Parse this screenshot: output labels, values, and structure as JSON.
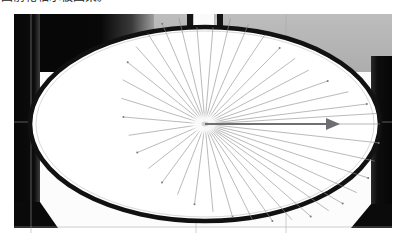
{
  "caption": {
    "text": "图前轮轴承被图架。",
    "note": "partially-clipped-chinese-caption"
  },
  "photo": {
    "title": "bicycle-front-wheel-oblique-photo",
    "frame": {
      "x": 14,
      "y": 14,
      "width": 378,
      "height": 219
    },
    "background_color": "#ffffff",
    "regions": [
      {
        "name": "top-left-dark-block",
        "color": "#0a0a0a",
        "x": 0,
        "y": 0,
        "width": 115,
        "height": 56
      },
      {
        "name": "top-right-gray-wall",
        "color": "#b5b5b5",
        "x": 115,
        "y": 0,
        "width": 263,
        "height": 56
      },
      {
        "name": "left-dark-column",
        "color": "#0b0b0b",
        "x": 0,
        "y": 0,
        "width": 24,
        "height": 215
      },
      {
        "name": "right-dark-column",
        "color": "#101010",
        "x": 358,
        "y": 40,
        "width": 20,
        "height": 175
      },
      {
        "name": "lower-white-floor",
        "color": "#fbfbfb",
        "x": 0,
        "y": 56,
        "width": 378,
        "height": 163
      }
    ],
    "guides": {
      "color": "#a9a9a9",
      "vertical_x": [
        17,
        182,
        272
      ],
      "horizontal_y": [
        108,
        213
      ]
    },
    "wheel": {
      "name": "front-wheel-ellipse",
      "center_x": 191,
      "center_y": 110,
      "radius_x": 175,
      "radius_y": 97,
      "rim_color": "#121212",
      "rim_width_px": 5,
      "tyre_fill": "#ffffff",
      "hub_center_x": 191,
      "hub_center_y": 110,
      "spoke_color": "#8e8e8e",
      "spoke_count": 32,
      "nipple_color": "#777777"
    },
    "fork": {
      "name": "front-fork",
      "color": "#151515",
      "left_leg_x": 176,
      "right_leg_x": 204,
      "leg_width": 6,
      "top_y": 0,
      "bend_y": 84,
      "crown_gap_color": "#f4f4f4"
    },
    "arrow": {
      "name": "radius-measurement-arrow",
      "color": "#6e6e73",
      "start_x": 191,
      "start_y": 110,
      "end_x": 326,
      "end_y": 110,
      "head_length": 14,
      "head_width": 12,
      "label": ""
    }
  }
}
